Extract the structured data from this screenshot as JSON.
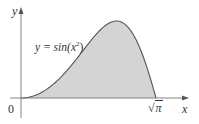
{
  "diagram": {
    "title": "",
    "axes": {
      "x_label": "x",
      "y_label": "y",
      "origin_label": "0"
    },
    "curve_label": "y = sin(x²)",
    "curve_label_parts": {
      "prefix": "y = sin(",
      "var": "x",
      "sup": "2",
      "suffix": ")"
    },
    "x_end_label": "√π",
    "x_end_label_parts": {
      "radical": "√",
      "arg": "π"
    },
    "shaded_region": "area under y = sin(x²) from 0 to √π",
    "colors": {
      "fill": "#d4d4d4",
      "curve": "#555555",
      "axis": "#777777",
      "text": "#333333"
    }
  },
  "chart_data": {
    "type": "area",
    "title": "",
    "function": "y = sin(x^2)",
    "xlabel": "x",
    "ylabel": "y",
    "x_range": [
      0,
      1.7725
    ],
    "x_ticks": [
      "0",
      "√π"
    ],
    "shaded_interval": [
      0,
      1.7725
    ],
    "peak": {
      "x": 1.2533,
      "y": 1.0
    },
    "x": [
      0,
      0.2,
      0.4,
      0.6,
      0.8,
      1.0,
      1.2,
      1.2533,
      1.4,
      1.6,
      1.7725
    ],
    "values": [
      0,
      0.04,
      0.159,
      0.352,
      0.597,
      0.841,
      0.991,
      1.0,
      0.925,
      0.549,
      0.0
    ]
  }
}
